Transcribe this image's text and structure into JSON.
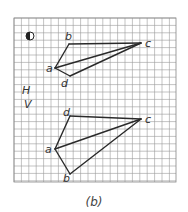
{
  "figure": {
    "caption": "(b)",
    "grid": {
      "x0": 14,
      "y0": 18,
      "x1": 176,
      "y1": 182,
      "cell": 7.4,
      "color": "#9a9a9a",
      "border": "#888888"
    },
    "symbol": {
      "name": "first-angle-projection-icon",
      "cx": 30,
      "cy": 36,
      "r": 4
    },
    "side_labels": [
      {
        "text": "H",
        "x": 22,
        "y": 94
      },
      {
        "text": "V",
        "x": 24,
        "y": 108
      }
    ],
    "top_view": {
      "label": "H",
      "vertices": {
        "a": {
          "x": 55,
          "y": 68,
          "lx": 46,
          "ly": 72
        },
        "b": {
          "x": 69,
          "y": 44,
          "lx": 65,
          "ly": 40
        },
        "c": {
          "x": 141,
          "y": 43,
          "lx": 145,
          "ly": 47
        },
        "d": {
          "x": 70,
          "y": 76,
          "lx": 61,
          "ly": 87
        }
      },
      "edges": [
        [
          "a",
          "b"
        ],
        [
          "b",
          "c"
        ],
        [
          "a",
          "c"
        ],
        [
          "a",
          "d"
        ],
        [
          "d",
          "c"
        ]
      ]
    },
    "front_view": {
      "label": "V",
      "vertices": {
        "a": {
          "x": 55,
          "y": 149,
          "lx": 45,
          "ly": 153
        },
        "b": {
          "x": 70,
          "y": 174,
          "lx": 63,
          "ly": 182
        },
        "c": {
          "x": 141,
          "y": 119,
          "lx": 145,
          "ly": 123
        },
        "d": {
          "x": 70,
          "y": 116,
          "lx": 63,
          "ly": 116
        }
      },
      "edges": [
        [
          "a",
          "d"
        ],
        [
          "d",
          "c"
        ],
        [
          "a",
          "c"
        ],
        [
          "a",
          "b"
        ],
        [
          "b",
          "c"
        ]
      ]
    },
    "line_color": "#2a2a2a"
  }
}
